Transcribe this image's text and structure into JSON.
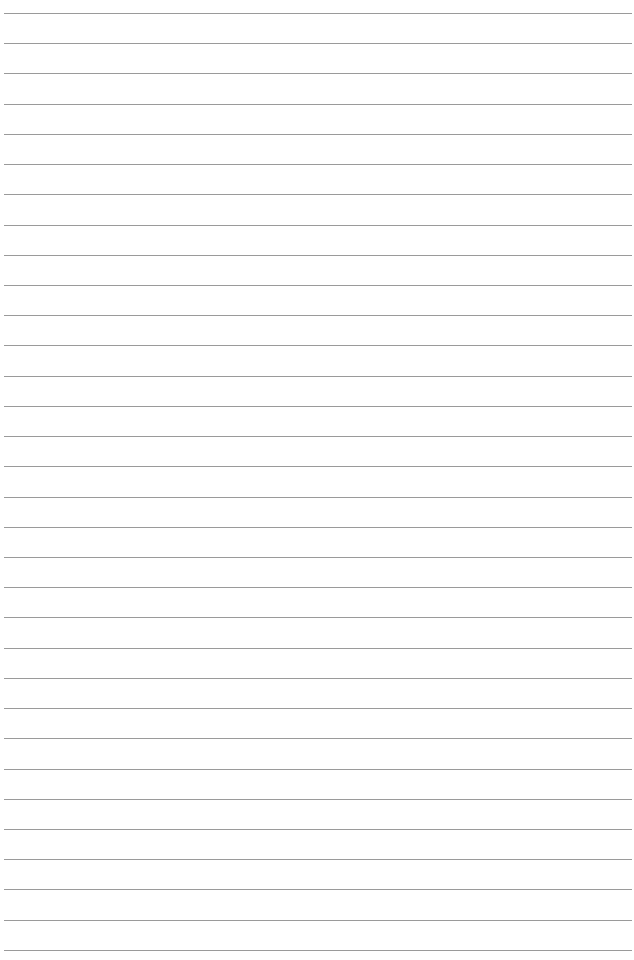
{
  "page": {
    "type": "lined-paper",
    "line_count": 32,
    "first_line_y": 13,
    "line_spacing": 30.22,
    "line_color": "#9a9a9a",
    "background_color": "#ffffff"
  }
}
